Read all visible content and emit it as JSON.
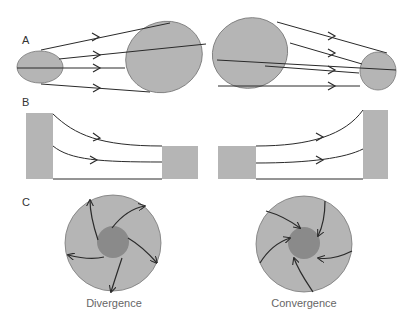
{
  "panels": {
    "a": {
      "label": "A"
    },
    "b": {
      "label": "B"
    },
    "c": {
      "label": "C"
    }
  },
  "captions": {
    "divergence": "Divergence",
    "convergence": "Convergence"
  },
  "colors": {
    "fill_light": "#b5b5b5",
    "fill_dark": "#8a8a8a",
    "stroke": "#2a2a2a"
  }
}
